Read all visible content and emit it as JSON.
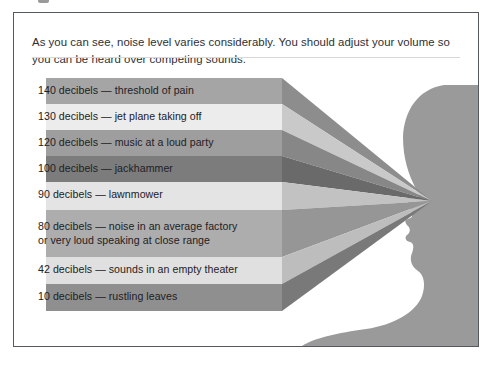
{
  "document": {
    "intro_paragraph": "As you can see, noise level varies considerably. You should adjust your volume so you can be heard over competing sounds."
  },
  "figure": {
    "name": "decibel-noise-level-diagram",
    "silhouette_color": "#9a9a9a",
    "convergence_point": {
      "x": 418,
      "y": 188
    },
    "bands": [
      {
        "level": "140",
        "unit": "decibels",
        "dash": "—",
        "source": "threshold of pain",
        "label": "140 decibels — threshold of pain",
        "color": "#a5a5a5",
        "taper_color": "#8d8d8d",
        "top": 15,
        "height": 26
      },
      {
        "level": "130",
        "unit": "decibels",
        "dash": "—",
        "source": "jet plane taking off",
        "label": "130 decibels — jet plane taking off",
        "color": "#ececec",
        "taper_color": "#c9c9c9",
        "top": 41,
        "height": 26
      },
      {
        "level": "120",
        "unit": "decibels",
        "dash": "—",
        "source": "music at a loud party",
        "label": "120 decibels — music at a loud party",
        "color": "#9e9e9e",
        "taper_color": "#878787",
        "top": 67,
        "height": 26
      },
      {
        "level": "100",
        "unit": "decibels",
        "dash": "—",
        "source": "jackhammer",
        "label": "100 decibels — jackhammer",
        "color": "#7c7c7c",
        "taper_color": "#6a6a6a",
        "top": 93,
        "height": 26
      },
      {
        "level": "90",
        "unit": "decibels",
        "dash": "—",
        "source": "lawnmower",
        "label": "90 decibels — lawnmower",
        "color": "#e4e4e4",
        "taper_color": "#c2c2c2",
        "top": 119,
        "height": 28
      },
      {
        "level": "80",
        "unit": "decibels",
        "dash": "—",
        "source": "noise in an average factory or very loud speaking at close range",
        "label": "80 decibels — noise in an average factory\nor very loud speaking at close range",
        "color": "#adadad",
        "taper_color": "#969696",
        "top": 147,
        "height": 47
      },
      {
        "level": "42",
        "unit": "decibels",
        "dash": "—",
        "source": "sounds in an empty theater",
        "label": "42 decibels — sounds in an empty theater",
        "color": "#e0e0e0",
        "taper_color": "#bdbdbd",
        "top": 194,
        "height": 27
      },
      {
        "level": "10",
        "unit": "decibels",
        "dash": "—",
        "source": "rustling leaves",
        "label": "10 decibels — rustling leaves",
        "color": "#8f8f8f",
        "taper_color": "#797979",
        "top": 221,
        "height": 27
      }
    ]
  }
}
